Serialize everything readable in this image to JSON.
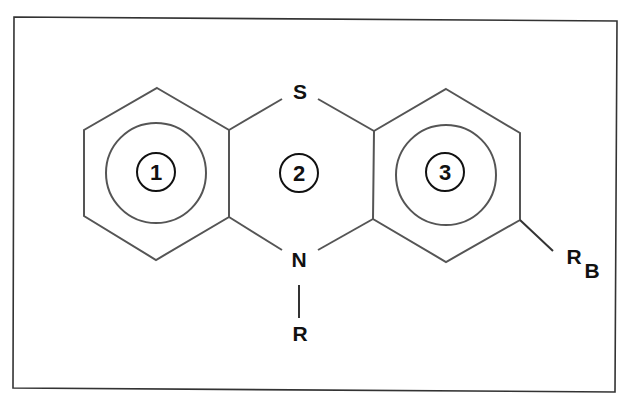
{
  "diagram": {
    "atoms": {
      "sulfur": "S",
      "nitrogen": "N",
      "n_substituent": "R",
      "ring_substituent_main": "R",
      "ring_substituent_sub": "B"
    },
    "ring_labels": [
      "1",
      "2",
      "3"
    ],
    "colors": {
      "frame": "#333333",
      "bonds": "#555555",
      "text": "#111111",
      "background": "#ffffff"
    }
  }
}
